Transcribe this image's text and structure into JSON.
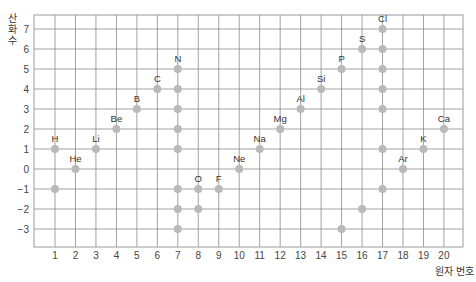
{
  "chart_data": {
    "type": "scatter",
    "title": "",
    "xlabel": "원자 번호",
    "ylabel": "산화수",
    "x_ticks": [
      1,
      2,
      3,
      4,
      5,
      6,
      7,
      8,
      9,
      10,
      11,
      12,
      13,
      14,
      15,
      16,
      17,
      18,
      19,
      20
    ],
    "y_ticks": [
      -3,
      -2,
      -1,
      0,
      1,
      2,
      3,
      4,
      5,
      6,
      7
    ],
    "xlim": [
      0,
      21
    ],
    "ylim": [
      -3.9,
      7.7
    ],
    "grid": true,
    "legend": null,
    "marker_color": "#b9b9b9",
    "grid_color": "#8a8a8a",
    "elements": [
      {
        "symbol": "H",
        "z": 1,
        "states": [
          1,
          -1
        ],
        "label_at": 1
      },
      {
        "symbol": "He",
        "z": 2,
        "states": [
          0
        ],
        "label_at": 0
      },
      {
        "symbol": "Li",
        "z": 3,
        "states": [
          1
        ],
        "label_at": 1
      },
      {
        "symbol": "Be",
        "z": 4,
        "states": [
          2
        ],
        "label_at": 2
      },
      {
        "symbol": "B",
        "z": 5,
        "states": [
          3
        ],
        "label_at": 3
      },
      {
        "symbol": "C",
        "z": 6,
        "states": [
          4
        ],
        "label_at": 4
      },
      {
        "symbol": "N",
        "z": 7,
        "states": [
          5,
          4,
          3,
          2,
          1,
          -1,
          -2,
          -3
        ],
        "label_at": 5
      },
      {
        "symbol": "O",
        "z": 8,
        "states": [
          -1,
          -2
        ],
        "label_at": -1
      },
      {
        "symbol": "F",
        "z": 9,
        "states": [
          -1
        ],
        "label_at": -1
      },
      {
        "symbol": "Ne",
        "z": 10,
        "states": [
          0
        ],
        "label_at": 0
      },
      {
        "symbol": "Na",
        "z": 11,
        "states": [
          1
        ],
        "label_at": 1
      },
      {
        "symbol": "Mg",
        "z": 12,
        "states": [
          2
        ],
        "label_at": 2
      },
      {
        "symbol": "Al",
        "z": 13,
        "states": [
          3
        ],
        "label_at": 3
      },
      {
        "symbol": "Si",
        "z": 14,
        "states": [
          4
        ],
        "label_at": 4
      },
      {
        "symbol": "P",
        "z": 15,
        "states": [
          5,
          -3
        ],
        "label_at": 5
      },
      {
        "symbol": "S",
        "z": 16,
        "states": [
          6,
          -2
        ],
        "label_at": 6
      },
      {
        "symbol": "Cl",
        "z": 17,
        "states": [
          7,
          6,
          5,
          4,
          3,
          1,
          -1
        ],
        "label_at": 7
      },
      {
        "symbol": "Ar",
        "z": 18,
        "states": [
          0
        ],
        "label_at": 0
      },
      {
        "symbol": "K",
        "z": 19,
        "states": [
          1
        ],
        "label_at": 1
      },
      {
        "symbol": "Ca",
        "z": 20,
        "states": [
          2
        ],
        "label_at": 2
      }
    ]
  }
}
